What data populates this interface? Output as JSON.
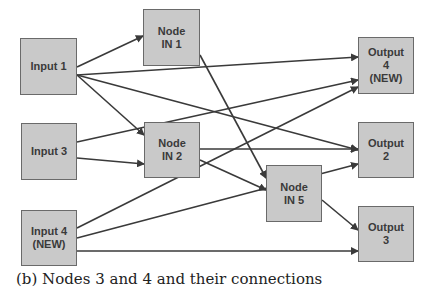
{
  "diagram": {
    "nodes": {
      "input1": {
        "label": "Input 1",
        "x": 20,
        "y": 38,
        "w": 57,
        "h": 57
      },
      "input3": {
        "label": "Input 3",
        "x": 21,
        "y": 123,
        "w": 56,
        "h": 57
      },
      "input4": {
        "label": "Input 4\n(NEW)",
        "x": 21,
        "y": 210,
        "w": 56,
        "h": 56
      },
      "nodeIn1": {
        "label": "Node\nIN 1",
        "x": 143,
        "y": 9,
        "w": 57,
        "h": 57
      },
      "nodeIn2": {
        "label": "Node\nIN 2",
        "x": 144,
        "y": 122,
        "w": 56,
        "h": 56
      },
      "nodeIn5": {
        "label": "Node\nIN 5",
        "x": 266,
        "y": 165,
        "w": 56,
        "h": 57
      },
      "output4": {
        "label": "Output\n4\n(NEW)",
        "x": 358,
        "y": 37,
        "w": 56,
        "h": 57
      },
      "output2": {
        "label": "Output\n2",
        "x": 358,
        "y": 122,
        "w": 56,
        "h": 56
      },
      "output3": {
        "label": "Output\n3",
        "x": 358,
        "y": 206,
        "w": 56,
        "h": 56
      }
    },
    "edges": [
      {
        "from": "Input 1",
        "to": "Node IN 1",
        "x1": 77,
        "y1": 67,
        "x2": 143,
        "y2": 36
      },
      {
        "from": "Input 1",
        "to": "Output 4 (NEW)",
        "x1": 77,
        "y1": 75,
        "x2": 358,
        "y2": 57
      },
      {
        "from": "Input 1",
        "to": "Output 2",
        "x1": 77,
        "y1": 75,
        "x2": 358,
        "y2": 150
      },
      {
        "from": "Input 1",
        "to": "Node IN 2",
        "x1": 77,
        "y1": 75,
        "x2": 144,
        "y2": 135
      },
      {
        "from": "Node IN 1",
        "to": "Node IN 5",
        "x1": 200,
        "y1": 55,
        "x2": 266,
        "y2": 178
      },
      {
        "from": "Input 3",
        "to": "Output 4 (NEW)",
        "x1": 77,
        "y1": 142,
        "x2": 358,
        "y2": 80
      },
      {
        "from": "Input 3",
        "to": "Node IN 2",
        "x1": 77,
        "y1": 158,
        "x2": 144,
        "y2": 164
      },
      {
        "from": "Input 4 (NEW)",
        "to": "Output 4 (NEW)",
        "x1": 77,
        "y1": 228,
        "x2": 358,
        "y2": 87
      },
      {
        "from": "Input 4 (NEW)",
        "to": "Output 2",
        "x1": 77,
        "y1": 238,
        "x2": 358,
        "y2": 164
      },
      {
        "from": "Input 4 (NEW)",
        "to": "Output 3",
        "x1": 77,
        "y1": 251,
        "x2": 358,
        "y2": 251
      },
      {
        "from": "Node IN 2",
        "to": "Output 2",
        "x1": 200,
        "y1": 149,
        "x2": 358,
        "y2": 149
      },
      {
        "from": "Node IN 2",
        "to": "Node IN 5",
        "x1": 200,
        "y1": 160,
        "x2": 266,
        "y2": 190
      },
      {
        "from": "Node IN 5",
        "to": "Output 3",
        "x1": 322,
        "y1": 200,
        "x2": 358,
        "y2": 230
      }
    ],
    "caption": "(b) Nodes 3 and 4 and their connections"
  },
  "colors": {
    "node_fill": "#c9c9c9",
    "node_border": "#6a6a6a",
    "edge": "#3a3a3a",
    "text": "#3a3a3a"
  }
}
